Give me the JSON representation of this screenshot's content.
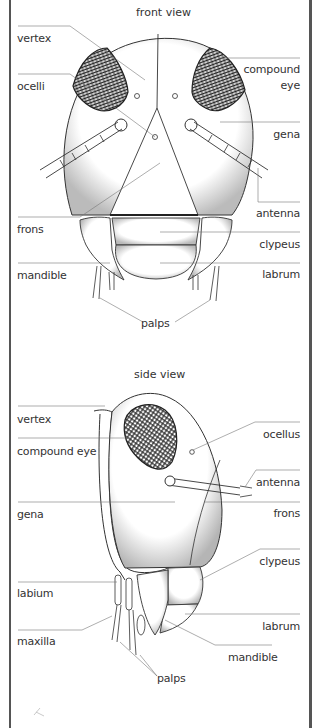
{
  "front_view": {
    "title": "front view",
    "labels": {
      "vertex": "vertex",
      "ocelli": "ocelli",
      "compound_eye_1": "compound",
      "compound_eye_2": "eye",
      "gena": "gena",
      "antenna": "antenna",
      "frons": "frons",
      "clypeus": "clypeus",
      "mandible": "mandible",
      "labrum": "labrum",
      "palps": "palps"
    }
  },
  "side_view": {
    "title": "side view",
    "labels": {
      "vertex": "vertex",
      "compound_eye": "compound eye",
      "ocellus": "ocellus",
      "antenna": "antenna",
      "gena": "gena",
      "frons": "frons",
      "clypeus": "clypeus",
      "labium": "labium",
      "labrum": "labrum",
      "maxilla": "maxilla",
      "mandible": "mandible",
      "palps": "palps"
    }
  },
  "colors": {
    "line": "#555555",
    "stipple": "#444444",
    "background": "#ffffff"
  }
}
